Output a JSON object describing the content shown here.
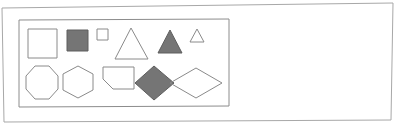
{
  "document": {
    "kind": "scanned-worksheet",
    "background_color": "#ffffff"
  },
  "outer_frame": {
    "name": "page-border",
    "stroke_color": "#a8a8a8",
    "stroke_width": 1,
    "fill": "none",
    "points": "2,8 393,3 391,120 4,122",
    "skewed": true
  },
  "panel": {
    "name": "shapes-panel",
    "stroke_color": "#8c8c8c",
    "stroke_width": 1,
    "fill": "none",
    "points": "19,20 229,19 229,106 19,107"
  },
  "palette": {
    "outline_stroke": "#8a8a8a",
    "fill_gray": "#757575",
    "fill_gray_stroke": "#5e5e5e",
    "paper_white": "#ffffff",
    "frame_gray": "#a8a8a8"
  },
  "shapes": [
    {
      "id": "square-large-outline",
      "name": "square-large-outline",
      "type": "square",
      "row": "top",
      "size": "large",
      "filled": false,
      "fill": "none",
      "stroke": "#8a8a8a",
      "stroke_width": 1,
      "points": "28,29 57,29 57,58 28,58"
    },
    {
      "id": "square-medium-filled",
      "name": "square-medium-filled",
      "type": "square",
      "row": "top",
      "size": "medium",
      "filled": true,
      "fill": "#757575",
      "stroke": "#5e5e5e",
      "stroke_width": 1,
      "points": "67,30 88,30 88,51 67,51"
    },
    {
      "id": "square-small-outline",
      "name": "square-small-outline",
      "type": "square",
      "row": "top",
      "size": "small",
      "filled": false,
      "fill": "none",
      "stroke": "#8a8a8a",
      "stroke_width": 1,
      "points": "97,29 108,29 108,40 97,40"
    },
    {
      "id": "triangle-large-outline",
      "name": "triangle-large-outline",
      "type": "triangle",
      "row": "top",
      "size": "large",
      "filled": false,
      "fill": "none",
      "stroke": "#8a8a8a",
      "stroke_width": 1,
      "points": "131,28 148,59 115,59"
    },
    {
      "id": "triangle-medium-filled",
      "name": "triangle-medium-filled",
      "type": "triangle",
      "row": "top",
      "size": "medium",
      "filled": true,
      "fill": "#757575",
      "stroke": "#5e5e5e",
      "stroke_width": 1,
      "points": "170,30 182,53 158,53"
    },
    {
      "id": "triangle-small-outline",
      "name": "triangle-small-outline",
      "type": "triangle",
      "row": "top",
      "size": "small",
      "filled": false,
      "fill": "none",
      "stroke": "#8a8a8a",
      "stroke_width": 1,
      "points": "197,29 204,42 190,42"
    },
    {
      "id": "octagon-outline",
      "name": "octagon-outline",
      "type": "octagon",
      "row": "bottom",
      "size": "large",
      "filled": false,
      "fill": "none",
      "stroke": "#8a8a8a",
      "stroke_width": 1,
      "points": "35,66 49,66 58,76 58,89 49,99 35,99 26,89 26,76"
    },
    {
      "id": "hexagon-outline",
      "name": "hexagon-outline",
      "type": "hexagon",
      "row": "bottom",
      "size": "large",
      "filled": false,
      "fill": "none",
      "stroke": "#8a8a8a",
      "stroke_width": 1,
      "points": "78,66 93,74 93,90 78,98 63,90 63,74"
    },
    {
      "id": "quadrilateral-outline",
      "name": "quadrilateral-outline",
      "type": "quadrilateral",
      "row": "bottom",
      "size": "medium",
      "filled": false,
      "fill": "none",
      "stroke": "#8a8a8a",
      "stroke_width": 1,
      "points": "103,67 134,67 134,89 113,89 103,79"
    },
    {
      "id": "diamond-filled",
      "name": "diamond-filled",
      "type": "diamond",
      "row": "bottom",
      "size": "medium",
      "filled": true,
      "fill": "#757575",
      "stroke": "#5e5e5e",
      "stroke_width": 1,
      "points": "154,66 174,83 154,100 135,83"
    },
    {
      "id": "rhombus-wide-outline",
      "name": "rhombus-wide-outline",
      "type": "rhombus",
      "row": "bottom",
      "size": "large",
      "filled": false,
      "fill": "none",
      "stroke": "#8a8a8a",
      "stroke_width": 1,
      "points": "196,68 222,83 196,98 170,83"
    }
  ]
}
